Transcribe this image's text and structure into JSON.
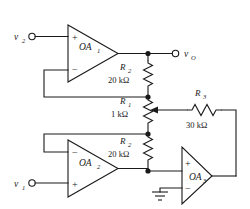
{
  "diagram": {
    "background_color": "#ffffff",
    "line_color": "#1a1a1a"
  },
  "terminals": [
    {
      "id": "v2",
      "name": "input-terminal-v2",
      "label": "v",
      "subscript": "2"
    },
    {
      "id": "v1",
      "name": "input-terminal-v1",
      "label": "v",
      "subscript": "1"
    },
    {
      "id": "vo",
      "name": "output-terminal-vo",
      "label": "v",
      "subscript": "O"
    }
  ],
  "opamps": [
    {
      "id": "oa1",
      "name": "op-amp-oa1",
      "label": "OA",
      "subscript": "1",
      "top_input": "+",
      "bottom_input": "−"
    },
    {
      "id": "oa2",
      "name": "op-amp-oa2",
      "label": "OA",
      "subscript": "2",
      "top_input": "−",
      "bottom_input": "+"
    },
    {
      "id": "oa3",
      "name": "op-amp-oa3",
      "label": "OA",
      "subscript": "3",
      "top_input": "+",
      "bottom_input": "−"
    }
  ],
  "resistors": [
    {
      "id": "r2_top",
      "name": "resistor-r2-top",
      "label": "R",
      "subscript": "2",
      "value": "20 kΩ",
      "orientation": "vertical"
    },
    {
      "id": "r1",
      "name": "resistor-r1-potentiometer",
      "label": "R",
      "subscript": "1",
      "value": "1 kΩ",
      "orientation": "vertical",
      "type": "potentiometer"
    },
    {
      "id": "r2_bottom",
      "name": "resistor-r2-bottom",
      "label": "R",
      "subscript": "2",
      "value": "20 kΩ",
      "orientation": "vertical"
    },
    {
      "id": "r3",
      "name": "resistor-r3",
      "label": "R",
      "subscript": "3",
      "value": "30 kΩ",
      "orientation": "horizontal"
    }
  ],
  "ground": {
    "name": "ground-symbol",
    "label": ""
  }
}
